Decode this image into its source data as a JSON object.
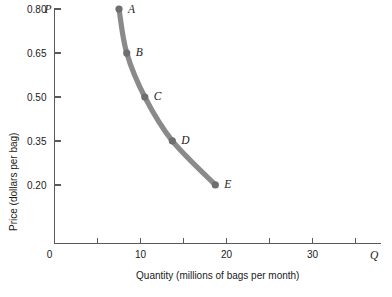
{
  "chart_data": {
    "type": "line",
    "title": "",
    "subtitle": "",
    "xlabel": "Quantity (millions of bags per month)",
    "ylabel": "Price (dollars per bag)",
    "x_axis_symbol": "Q",
    "y_axis_symbol": "P",
    "origin_label": "0",
    "xlim": [
      0,
      37
    ],
    "ylim": [
      0,
      0.875
    ],
    "grid": false,
    "legend": "none",
    "x_ticks": [
      5,
      10,
      15,
      20,
      25,
      30,
      35
    ],
    "x_tick_labels": [
      "",
      "10",
      "",
      "20",
      "",
      "30",
      ""
    ],
    "y_ticks": [
      0.2,
      0.35,
      0.5,
      0.65,
      0.8
    ],
    "y_tick_labels": [
      "0.20",
      "0.35",
      "0.50",
      "0.65",
      "0.80"
    ],
    "series": [
      {
        "name": "Demand curve",
        "color": "#8a8a8a",
        "points": [
          {
            "label": "A",
            "x": 7.5,
            "y": 0.8
          },
          {
            "label": "B",
            "x": 8.4,
            "y": 0.65
          },
          {
            "label": "C",
            "x": 10.5,
            "y": 0.5
          },
          {
            "label": "D",
            "x": 13.7,
            "y": 0.35
          },
          {
            "label": "E",
            "x": 18.7,
            "y": 0.2
          }
        ]
      }
    ],
    "colors": {
      "curve": "#8a8a8a",
      "point": "#6e6e6e",
      "axis": "#5a5a5a",
      "text": "#1a1a1a",
      "background": "#ffffff"
    }
  }
}
